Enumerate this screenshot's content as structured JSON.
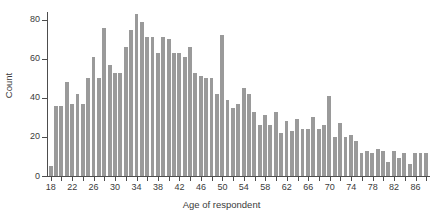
{
  "chart_data": {
    "type": "bar",
    "title": "",
    "subtitle": "",
    "xlabel": "Age of respondent",
    "ylabel": "Count",
    "xlim": [
      17,
      89
    ],
    "ylim": [
      0,
      85
    ],
    "grid": false,
    "legend": null,
    "bar_color": "#9a9a9a",
    "axis_color": "#4d4d4d",
    "text_color": "#3b3b3b",
    "background": "#ffffff",
    "y_ticks": [
      0,
      20,
      40,
      60,
      80
    ],
    "x_ticks": [
      18,
      20,
      22,
      24,
      26,
      28,
      30,
      32,
      34,
      36,
      38,
      40,
      42,
      44,
      46,
      48,
      50,
      52,
      54,
      56,
      58,
      60,
      62,
      64,
      66,
      68,
      70,
      72,
      74,
      76,
      78,
      80,
      82,
      84,
      86,
      88
    ],
    "x_tick_labels": [
      "18",
      "",
      "22",
      "",
      "26",
      "",
      "30",
      "",
      "34",
      "",
      "38",
      "",
      "42",
      "",
      "46",
      "",
      "50",
      "",
      "54",
      "",
      "58",
      "",
      "62",
      "",
      "66",
      "",
      "70",
      "",
      "74",
      "",
      "78",
      "",
      "82",
      "",
      "86",
      ""
    ],
    "categories": [
      18,
      19,
      20,
      21,
      22,
      23,
      24,
      25,
      26,
      27,
      28,
      29,
      30,
      31,
      32,
      33,
      34,
      35,
      36,
      37,
      38,
      39,
      40,
      41,
      42,
      43,
      44,
      45,
      46,
      47,
      48,
      49,
      50,
      51,
      52,
      53,
      54,
      55,
      56,
      57,
      58,
      59,
      60,
      61,
      62,
      63,
      64,
      65,
      66,
      67,
      68,
      69,
      70,
      71,
      72,
      73,
      74,
      75,
      76,
      77,
      78,
      79,
      80,
      81,
      82,
      83,
      84,
      85,
      86,
      87,
      88
    ],
    "values": [
      5,
      36,
      36,
      48,
      37,
      42,
      37,
      50,
      61,
      50,
      76,
      57,
      53,
      53,
      66,
      75,
      83,
      79,
      71,
      71,
      63,
      71,
      70,
      63,
      63,
      61,
      66,
      53,
      51,
      50,
      50,
      42,
      72,
      39,
      35,
      37,
      45,
      42,
      33,
      26,
      31,
      26,
      33,
      22,
      28,
      23,
      29,
      24,
      24,
      30,
      24,
      26,
      41,
      20,
      27,
      20,
      21,
      18,
      12,
      13,
      12,
      14,
      13,
      7,
      13,
      9,
      12,
      6,
      12,
      12,
      12
    ]
  },
  "axis": {
    "x_title": "Age of respondent",
    "y_title": "Count"
  }
}
